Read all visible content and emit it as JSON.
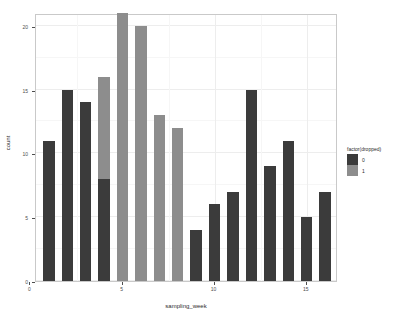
{
  "chart_data": {
    "type": "bar",
    "title": "",
    "subtitle": "",
    "xlabel": "sampling_week",
    "ylabel": "count",
    "stacked": true,
    "grid": true,
    "legend_position": "right",
    "xlim": [
      0.3,
      16.7
    ],
    "ylim": [
      0,
      21
    ],
    "x_ticks": [
      0,
      5,
      10,
      15
    ],
    "x_tick_labels": [
      "0",
      "5",
      "10",
      "15"
    ],
    "y_ticks": [
      0,
      5,
      10,
      15,
      20
    ],
    "y_tick_labels": [
      "0",
      "5",
      "10",
      "15",
      "20"
    ],
    "x": [
      1,
      2,
      3,
      4,
      5,
      6,
      7,
      8,
      9,
      10,
      11,
      12,
      13,
      14,
      15,
      16
    ],
    "series": [
      {
        "name": "0",
        "color": "#3b3b3b",
        "values": [
          11,
          15,
          14,
          8,
          0,
          0,
          0,
          0,
          4,
          6,
          7,
          15,
          9,
          11,
          5,
          7
        ]
      },
      {
        "name": "1",
        "color": "#8d8d8d",
        "values": [
          0,
          0,
          0,
          8,
          21,
          20,
          13,
          12,
          0,
          0,
          0,
          0,
          0,
          0,
          0,
          0
        ]
      }
    ],
    "totals": [
      11,
      15,
      14,
      16,
      21,
      20,
      13,
      12,
      4,
      6,
      7,
      15,
      9,
      11,
      5,
      7
    ]
  },
  "legend": {
    "title": "factor(dropped)",
    "entries": [
      {
        "label": "0",
        "color": "#3b3b3b"
      },
      {
        "label": "1",
        "color": "#8d8d8d"
      }
    ]
  },
  "axes": {
    "x_title": "sampling_week",
    "y_title": "count"
  },
  "colors": {
    "panel_background": "#ffffff",
    "panel_border": "#c9c9c9",
    "grid_major": "#ededed",
    "grid_minor": "#f6f6f6",
    "text": "#2b2b2b",
    "tick_text": "#4d4d4d",
    "series_0": "#3b3b3b",
    "series_1": "#8d8d8d"
  }
}
